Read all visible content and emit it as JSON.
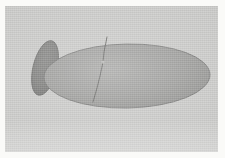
{
  "figure": {
    "medium": "halftone print scan",
    "orientation": "lateral view, anterior to the left",
    "faint_caption": "",
    "colors": {
      "paper": "#f7f7f5",
      "plate_background": "#c9c9c7",
      "body_fill": "#9a9a98",
      "body_outline": "#6e6e6c",
      "appendage_fill": "#7b7b79",
      "appendage_outline": "#5e5e5c",
      "suture_line": "#5a5a58",
      "node_highlight": "#c4c4c2",
      "scan_edge": "#fafaf8"
    },
    "parts": [
      {
        "id": "body",
        "name": "body-ellipse",
        "label": "Body",
        "shape": "ellipse",
        "center_x": 122,
        "center_y": 70,
        "radius_x": 83,
        "radius_y": 32,
        "rotation_deg": -1,
        "fill": "#9a9a98"
      },
      {
        "id": "appendage",
        "name": "anterior-appendage",
        "label": "Anterior appendage",
        "shape": "ellipse",
        "center_x": 40,
        "center_y": 62,
        "radius_x": 12,
        "radius_y": 28,
        "rotation_deg": 14,
        "fill": "#7b7b79"
      },
      {
        "id": "suture",
        "name": "suture-line",
        "label": "Suture line",
        "shape": "polyline",
        "points": "102,31 99,46 98,56 95,70 92,82 88,96",
        "stroke": "#5a5a58",
        "stroke_width": 0.9
      },
      {
        "id": "node",
        "name": "suture-node",
        "label": "Suture node",
        "shape": "point",
        "center_x": 98,
        "center_y": 56,
        "radius": 1.6,
        "fill": "#c4c4c2"
      }
    ],
    "plate": {
      "x": 5,
      "y": 6,
      "width": 213,
      "height": 146
    },
    "canvas": {
      "width": 225,
      "height": 158
    }
  }
}
